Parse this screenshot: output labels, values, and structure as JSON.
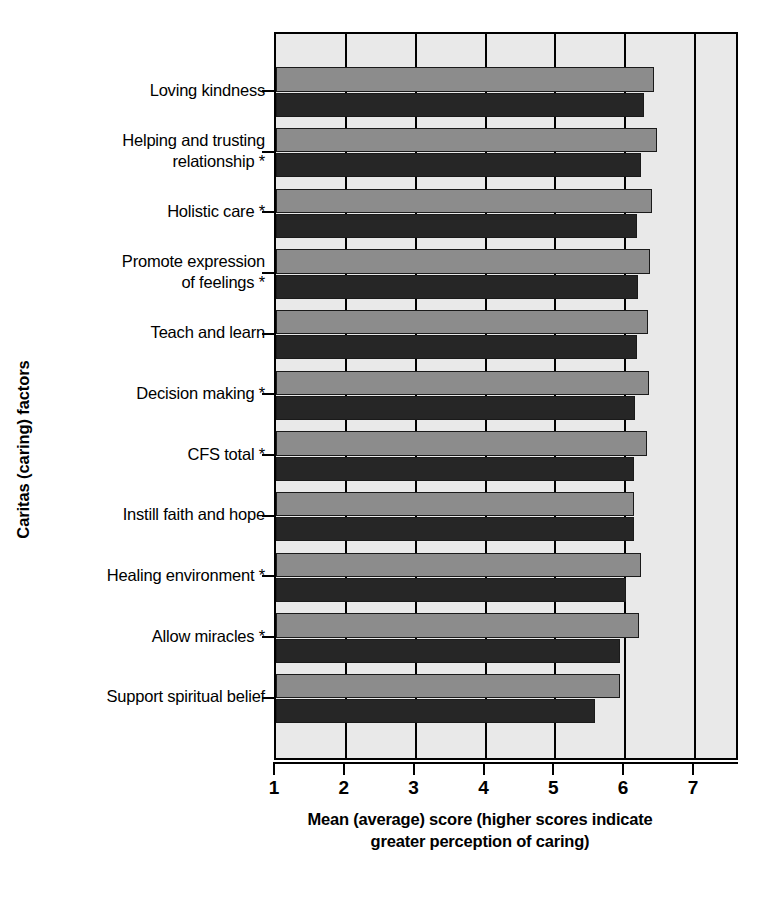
{
  "chart_data": {
    "type": "bar",
    "orientation": "horizontal",
    "title": "",
    "xlabel": "Mean (average) score (higher scores indicate greater perception of caring)",
    "xlabel_line1": "Mean (average) score (higher scores indicate",
    "xlabel_line2": "greater perception of caring)",
    "ylabel": "Caritas (caring) factors",
    "xlim": [
      1,
      7
    ],
    "xticks": [
      1,
      2,
      3,
      4,
      5,
      6,
      7
    ],
    "xticklabels": [
      "1",
      "2",
      "3",
      "4",
      "5",
      "6",
      "7"
    ],
    "grid": true,
    "legend": "none",
    "categories": [
      "Loving kindness",
      "Helping and trusting\nrelationship *",
      "Holistic care *",
      "Promote expression\nof feelings *",
      "Teach and learn",
      "Decision making *",
      "CFS total *",
      "Instill faith and hope",
      "Healing environment *",
      "Allow miracles *",
      "Support spiritual belief"
    ],
    "series": [
      {
        "name": "series-light",
        "color": "#8c8c8c",
        "values": [
          6.41,
          6.45,
          6.38,
          6.35,
          6.32,
          6.34,
          6.31,
          6.13,
          6.22,
          6.2,
          5.93
        ]
      },
      {
        "name": "series-dark",
        "color": "#262626",
        "values": [
          6.27,
          6.22,
          6.17,
          6.19,
          6.17,
          6.14,
          6.12,
          6.13,
          6.01,
          5.93,
          5.57
        ]
      }
    ]
  },
  "caption": ""
}
